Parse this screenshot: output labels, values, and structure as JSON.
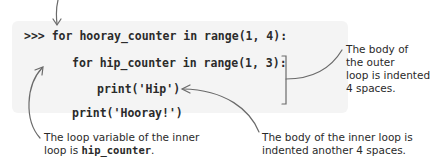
{
  "code": {
    "lines": [
      ">>> for hooray_counter in range(1, 4):",
      "for hip_counter in range(1, 3):",
      "print('Hip')",
      "print('Hooray!')"
    ]
  },
  "annotations": {
    "outer_body": [
      "The body of",
      "the outer",
      "loop is indented",
      "4 spaces."
    ],
    "inner_var_prefix": "The loop variable of the inner",
    "inner_var_line2_prefix": "loop is ",
    "inner_var_name": "hip_counter",
    "inner_var_suffix": ".",
    "inner_body": [
      "The body of the inner loop is",
      "indented another 4 spaces."
    ]
  },
  "colors": {
    "code_background": "#f4f4f4",
    "arrow": "#6a6a6a",
    "text": "#2a2a2a"
  }
}
